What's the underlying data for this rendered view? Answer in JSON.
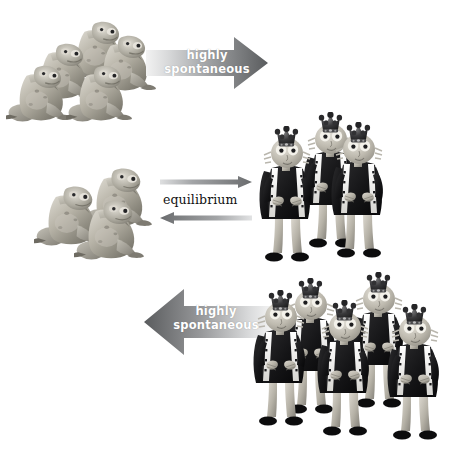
{
  "diagram": {
    "background_color": "#ffffff",
    "arrow_dark_color": "#5f6062",
    "arrow_light_color": "#e4e5e6",
    "label_text_color": "#ffffff",
    "equilibrium_text_color": "#111111"
  },
  "arrows": {
    "top": {
      "line1": "highly",
      "line2": "spontaneous",
      "direction": "right",
      "icon": "arrow-right-icon"
    },
    "equilibrium": {
      "label": "equilibrium",
      "forward_icon": "arrow-right-icon",
      "reverse_icon": "arrow-left-icon"
    },
    "bottom": {
      "line1": "highly",
      "line2": "spontaneous",
      "direction": "left",
      "icon": "arrow-left-icon"
    }
  },
  "groups": {
    "top_left_frogs": {
      "species": "frog",
      "count": 5,
      "label": "crowned frogs"
    },
    "mid_left_frogs": {
      "species": "frog",
      "count": 3,
      "label": "crowned frogs"
    },
    "mid_right_princes": {
      "species": "prince",
      "count": 3,
      "label": "crowned princes"
    },
    "bottom_right_princes": {
      "species": "prince",
      "count": 5,
      "label": "crowned princes"
    }
  }
}
